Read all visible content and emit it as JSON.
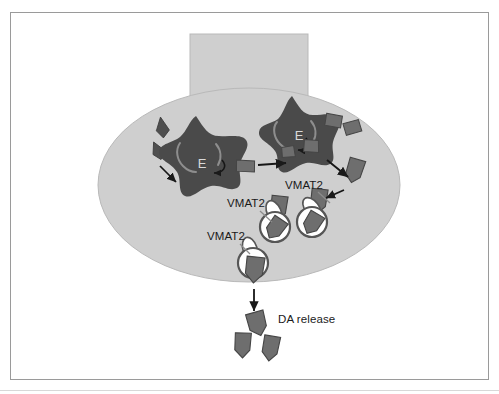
{
  "figure": {
    "domain": "diagram",
    "title_visible": false,
    "background_color": "#ffffff",
    "frame_color": "#9a9a9a"
  },
  "colors": {
    "cell_fill": "#cfcfcf",
    "cell_stroke": "#b5b5b5",
    "enzyme_fill": "#4a4a4a",
    "enzyme_label_fill": "#d9d9d9",
    "dopamine_fill": "#6e6e6e",
    "dopamine_stroke": "#4a4a4a",
    "precursor_fill": "#4f4f4f",
    "vesicle_fill": "#ffffff",
    "vesicle_stroke": "#5a5a5a",
    "transporter_fill": "#ffffff",
    "transporter_stroke": "#5a5a5a",
    "arrow_color": "#1a1a1a",
    "leader_color": "#8c8c8c",
    "text_color": "#1a1a1a"
  },
  "cell": {
    "name": "dopaminergic-neuron-terminal",
    "soma_ellipse": {
      "cx": 249,
      "cy": 185,
      "rx": 151,
      "ry": 97
    },
    "axon_rect": {
      "x": 190,
      "y": 34,
      "width": 118,
      "height": 100
    }
  },
  "enzymes": [
    {
      "id": "enzyme-left",
      "label": "E",
      "label_x": 202,
      "label_y": 168,
      "center": {
        "cx": 196,
        "cy": 160
      },
      "radius": 44
    },
    {
      "id": "enzyme-right",
      "label": "E",
      "label_x": 299,
      "label_y": 140,
      "center": {
        "cx": 294,
        "cy": 136
      },
      "radius": 42
    }
  ],
  "labels": [
    {
      "id": "vmat2-right",
      "text": "VMAT2",
      "x": 285,
      "y": 189,
      "anchor": "start",
      "leader": {
        "x1": 318,
        "y1": 193,
        "x2": 330,
        "y2": 205
      }
    },
    {
      "id": "vmat2-middle",
      "text": "VMAT2",
      "x": 227,
      "y": 207,
      "anchor": "start",
      "leader": {
        "x1": 262,
        "y1": 211,
        "x2": 275,
        "y2": 222
      }
    },
    {
      "id": "vmat2-left",
      "text": "VMAT2",
      "x": 207,
      "y": 240,
      "anchor": "start",
      "leader": {
        "x1": 242,
        "y1": 244,
        "x2": 254,
        "y2": 255
      }
    },
    {
      "id": "da-release",
      "text": "DA release",
      "x": 278,
      "y": 323,
      "anchor": "start",
      "leader": null
    }
  ],
  "vesicles": [
    {
      "id": "vesicle-right",
      "cx": 312,
      "cy": 221,
      "r": 15,
      "transporter_angle": -38
    },
    {
      "id": "vesicle-middle",
      "cx": 275,
      "cy": 226,
      "r": 15,
      "transporter_angle": -26
    },
    {
      "id": "vesicle-exocytosing",
      "cx": 253,
      "cy": 263,
      "r": 15,
      "transporter_angle": -22
    }
  ],
  "dopamine_molecules": [
    {
      "id": "da-cytosol-a",
      "x": 331,
      "y": 119,
      "rot": 14,
      "shape": "quad"
    },
    {
      "id": "da-cytosol-b",
      "x": 351,
      "y": 127,
      "rot": -10,
      "shape": "quad"
    },
    {
      "id": "da-transport-1",
      "x": 352,
      "y": 166,
      "rot": 18,
      "shape": "pentagon"
    },
    {
      "id": "da-transport-2",
      "x": 318,
      "y": 197,
      "rot": 8,
      "shape": "pentagon"
    },
    {
      "id": "da-loaded-right",
      "x": 313,
      "y": 222,
      "rot": 30,
      "shape": "pentagon"
    },
    {
      "id": "da-loaded-middle",
      "x": 276,
      "y": 228,
      "rot": 34,
      "shape": "pentagon"
    },
    {
      "id": "da-loaded-exo",
      "x": 255,
      "y": 268,
      "rot": 8,
      "shape": "pentagon"
    },
    {
      "id": "da-synthesized",
      "x": 245,
      "y": 164,
      "rot": 6,
      "shape": "quad"
    },
    {
      "id": "da-released-1",
      "x": 256,
      "y": 322,
      "rot": -14,
      "shape": "pentagon"
    },
    {
      "id": "da-released-2",
      "x": 243,
      "y": 343,
      "rot": 4,
      "shape": "pentagon"
    },
    {
      "id": "da-released-3",
      "x": 269,
      "y": 346,
      "rot": 10,
      "shape": "pentagon"
    }
  ],
  "precursors": [
    {
      "id": "precursor-tyrosine",
      "x": 162,
      "y": 128,
      "rot": -8
    },
    {
      "id": "precursor-ldopa",
      "x": 158,
      "y": 150,
      "rot": -30
    }
  ],
  "arrows": [
    {
      "id": "arrow-precursor-to-enzyme",
      "x1": 160,
      "y1": 166,
      "x2": 178,
      "y2": 183
    },
    {
      "id": "arrow-enzyme-left-to-right",
      "x1": 253,
      "y1": 166,
      "x2": 281,
      "y2": 164
    },
    {
      "id": "arrow-enzyme-right-to-da",
      "x1": 320,
      "y1": 160,
      "x2": 348,
      "y2": 178
    },
    {
      "id": "arrow-da-to-vesicle",
      "x1": 347,
      "y1": 192,
      "x2": 325,
      "y2": 201
    },
    {
      "id": "arrow-da-into-vesicle-right",
      "x1": 314,
      "y1": 203,
      "x2": 314,
      "y2": 214
    },
    {
      "id": "arrow-da-into-vesicle-mid",
      "x1": 277,
      "y1": 208,
      "x2": 277,
      "y2": 219
    },
    {
      "id": "arrow-da-into-vesicle-exo",
      "x1": 254,
      "y1": 246,
      "x2": 254,
      "y2": 257
    },
    {
      "id": "arrow-exocytosis",
      "x1": 254,
      "y1": 288,
      "x2": 254,
      "y2": 312
    }
  ]
}
